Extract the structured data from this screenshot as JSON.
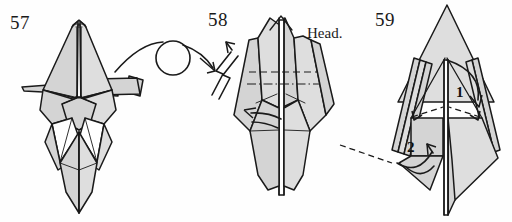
{
  "document": {
    "kind": "origami-instruction-diagram",
    "background_color": "#fefefe",
    "paper_fill_color": "#d4d4d4",
    "paper_fill_light_color": "#dedede",
    "paper_white_color": "#ffffff",
    "ink_color": "#1a1a1a"
  },
  "figures": [
    {
      "id": "figure-57",
      "step_number": "57",
      "label_position": {
        "x": 10,
        "y": 12
      }
    },
    {
      "id": "figure-58",
      "step_number": "58",
      "label_position": {
        "x": 208,
        "y": 9
      },
      "annotations": [
        {
          "name": "head-label",
          "text": "Head.",
          "x": 307,
          "y": 25
        }
      ]
    },
    {
      "id": "figure-59",
      "step_number": "59",
      "label_position": {
        "x": 375,
        "y": 9
      },
      "annotations": [
        {
          "name": "fold-order-1",
          "text": "1",
          "x": 456,
          "y": 84
        },
        {
          "name": "fold-order-2",
          "text": "2",
          "x": 407,
          "y": 139
        }
      ]
    }
  ],
  "arrows": [
    {
      "name": "turn-over-arrow",
      "type": "turn-over",
      "description": "curved arc with open circle indicating turn the model over",
      "from_figure": "figure-57",
      "to_figure": "figure-58"
    },
    {
      "name": "pleat-zigzag-arrow",
      "type": "pleat",
      "description": "zigzag shaft arrow pointing up-right into figure 58",
      "figure": "figure-58"
    },
    {
      "name": "fold-arrow-1",
      "type": "curved-fold",
      "order": "1",
      "figure": "figure-59"
    },
    {
      "name": "fold-arrow-2",
      "type": "curved-fold",
      "order": "2",
      "figure": "figure-59"
    }
  ],
  "fold_lines": [
    {
      "name": "valley-fold-line",
      "style": "dashed",
      "figure": "figure-58"
    },
    {
      "name": "mountain-fold-line",
      "style": "dash-dot",
      "figure": "figure-58"
    },
    {
      "name": "hidden-edge-line",
      "style": "dashed",
      "figure": "figure-59"
    }
  ]
}
